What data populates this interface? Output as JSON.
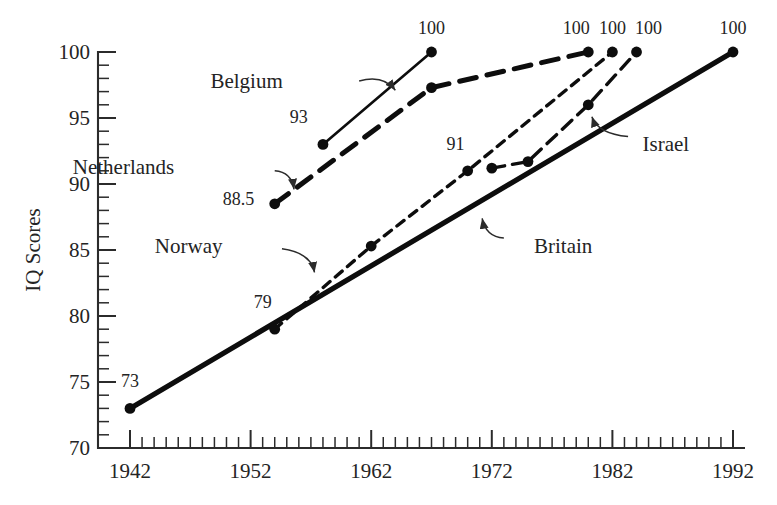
{
  "chart_data": {
    "type": "line",
    "title": "",
    "xlabel": "",
    "ylabel": "IQ Scores",
    "xlim": [
      1942,
      1992
    ],
    "ylim": [
      70,
      100
    ],
    "grid": false,
    "legend": "inline-annotations",
    "x_ticks": [
      "1942",
      "1952",
      "1962",
      "1972",
      "1982",
      "1992"
    ],
    "x_tick_values": [
      1942,
      1952,
      1962,
      1972,
      1982,
      1992
    ],
    "x_minor_step": 1,
    "y_ticks": [
      "70",
      "75",
      "80",
      "85",
      "90",
      "95",
      "100"
    ],
    "y_tick_values": [
      70,
      75,
      80,
      85,
      90,
      95,
      100
    ],
    "y_minor_step": 1,
    "series": [
      {
        "name": "Britain",
        "style": "solid-thick",
        "x": [
          1942,
          1992
        ],
        "values": [
          73,
          100
        ],
        "point_labels": [
          "73",
          "100"
        ]
      },
      {
        "name": "Norway",
        "style": "short-dash",
        "x": [
          1954,
          1962,
          1970,
          1982
        ],
        "values": [
          79,
          85.3,
          91,
          100
        ],
        "point_labels": [
          "79",
          "",
          "91",
          "100"
        ]
      },
      {
        "name": "Netherlands",
        "style": "long-dash",
        "x": [
          1954,
          1967,
          1980
        ],
        "values": [
          88.5,
          97.3,
          100
        ],
        "point_labels": [
          "88.5",
          "",
          "100"
        ]
      },
      {
        "name": "Belgium",
        "style": "solid-thin",
        "x": [
          1958,
          1967
        ],
        "values": [
          93,
          100
        ],
        "point_labels": [
          "93",
          "100"
        ]
      },
      {
        "name": "Israel",
        "style": "medium-dash",
        "x": [
          1972,
          1975,
          1980,
          1984
        ],
        "values": [
          91.2,
          91.7,
          96,
          100
        ],
        "point_labels": [
          "",
          "",
          "",
          "100"
        ]
      }
    ],
    "value_labels": [
      {
        "text": "73",
        "x": 1942,
        "y": 74.6
      },
      {
        "text": "79",
        "x": 1953,
        "y": 80.6
      },
      {
        "text": "88.5",
        "x": 1951,
        "y": 88.4
      },
      {
        "text": "93",
        "x": 1956,
        "y": 94.6
      },
      {
        "text": "91",
        "x": 1969,
        "y": 92.6
      },
      {
        "text": "100",
        "x": 1967,
        "y": 101.4
      },
      {
        "text": "100",
        "x": 1979,
        "y": 101.4
      },
      {
        "text": "100",
        "x": 1982,
        "y": 101.4
      },
      {
        "text": "100",
        "x": 1985,
        "y": 101.4
      },
      {
        "text": "100",
        "x": 1992,
        "y": 101.4
      }
    ],
    "annotations": [
      {
        "label": "Belgium",
        "x": 1955,
        "y": 97.8
      },
      {
        "label": "Netherlands",
        "x": 1946,
        "y": 91.3
      },
      {
        "label": "Norway",
        "x": 1950,
        "y": 85.3
      },
      {
        "label": "Britain",
        "x": 1975,
        "y": 85.3
      },
      {
        "label": "Israel",
        "x": 1984,
        "y": 93.0
      }
    ],
    "colors": {
      "line": "#0d0d0d",
      "axis": "#2b2b2b",
      "text": "#242424",
      "background": "#ffffff"
    }
  }
}
